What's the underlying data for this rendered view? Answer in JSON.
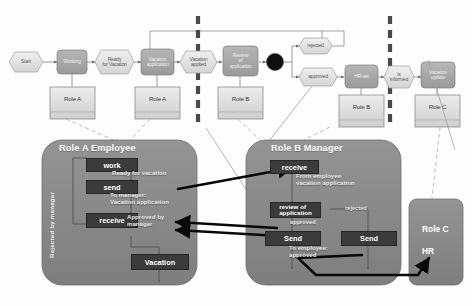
{
  "diagram": {
    "colors": {
      "event_fill": "#e3e3e3",
      "function_fill": "#a8a8a8",
      "pool_fill": "#8a8a8a",
      "inner_box_fill": "#3b3b3b",
      "connector_gray": "#8d8d8d",
      "dashed_divider": "#4d4d4d",
      "arrow_black": "#0a0a0a"
    },
    "top_flow": {
      "nodes": [
        {
          "id": "start",
          "label": "Start",
          "shape": "event"
        },
        {
          "id": "working",
          "label": "Working",
          "shape": "function"
        },
        {
          "id": "ready",
          "label": "Ready\nfor Vacation",
          "shape": "event"
        },
        {
          "id": "vac_app",
          "label": "Vacation\napplication",
          "shape": "function"
        },
        {
          "id": "vac_applied",
          "label": "Vacation\napplied",
          "shape": "event"
        },
        {
          "id": "review",
          "label": "Review\nof\napplication",
          "shape": "function"
        },
        {
          "id": "xor",
          "label": "",
          "shape": "connector-xor"
        },
        {
          "id": "rejected",
          "label": "rejected",
          "shape": "event"
        },
        {
          "id": "approved",
          "label": "approved",
          "shape": "event"
        },
        {
          "id": "hr_set",
          "label": "HR-set",
          "shape": "function"
        },
        {
          "id": "is_informed",
          "label": "is\ninformed",
          "shape": "event"
        },
        {
          "id": "vac_update",
          "label": "Vacation\nupdate",
          "shape": "function"
        }
      ],
      "role_boxes": [
        {
          "id": "rb1",
          "label": "Role A"
        },
        {
          "id": "rb2",
          "label": "Role A"
        },
        {
          "id": "rb3",
          "label": "Role B"
        },
        {
          "id": "rb4",
          "label": "Role B"
        },
        {
          "id": "rb5",
          "label": "Role C"
        }
      ]
    },
    "pools": {
      "role_a": {
        "title": "Role A Employee",
        "side_label": "Rejected by manager",
        "steps": [
          {
            "id": "a-work",
            "label": "work"
          },
          {
            "id": "a-send",
            "label": "send"
          },
          {
            "id": "a-receive",
            "label": "receive"
          },
          {
            "id": "a-vacation",
            "label": "Vacation"
          }
        ],
        "annotations": [
          {
            "id": "a-ann-ready",
            "text": "Ready for  vacation"
          },
          {
            "id": "a-ann-tomanager",
            "text": "To manager:\nVacation application"
          },
          {
            "id": "a-ann-approved",
            "text": "Approved by\nmanager"
          }
        ]
      },
      "role_b": {
        "title": "Role B Manager",
        "steps": [
          {
            "id": "b-receive",
            "label": "receive"
          },
          {
            "id": "b-review",
            "label": "review of\napplication"
          },
          {
            "id": "b-send-1",
            "label": "Send"
          },
          {
            "id": "b-send-2",
            "label": "Send"
          }
        ],
        "annotations": [
          {
            "id": "b-ann-from",
            "text": "From employee\nvacation application"
          },
          {
            "id": "b-ann-rejected",
            "text": "rejected"
          },
          {
            "id": "b-ann-approved",
            "text": "approved"
          },
          {
            "id": "b-ann-toemp",
            "text": "To employee:\napproved"
          }
        ]
      },
      "role_c": {
        "title_line1": "Role C",
        "title_line2": "HR"
      }
    }
  }
}
